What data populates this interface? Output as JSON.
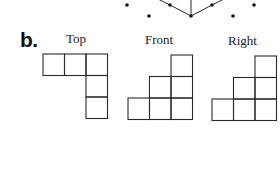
{
  "figure": {
    "part_label": "b.",
    "isometric_dot_diagram": {
      "dots": [
        {
          "x": 127,
          "y": 5
        },
        {
          "x": 170,
          "y": 5
        },
        {
          "x": 212,
          "y": 5
        },
        {
          "x": 254,
          "y": 5
        },
        {
          "x": 149,
          "y": 16
        },
        {
          "x": 191,
          "y": 16
        },
        {
          "x": 233,
          "y": 16
        }
      ],
      "edges": [
        {
          "x1": 158,
          "y1": -1,
          "x2": 170,
          "y2": 5
        },
        {
          "x1": 170,
          "y1": 5,
          "x2": 191,
          "y2": 16
        },
        {
          "x1": 191,
          "y1": 16,
          "x2": 212,
          "y2": 5
        },
        {
          "x1": 212,
          "y1": 5,
          "x2": 224,
          "y2": -1
        },
        {
          "x1": 191,
          "y1": 16,
          "x2": 191,
          "y2": -1
        }
      ]
    },
    "views": [
      {
        "name": "Top",
        "label": "Top",
        "label_pos": {
          "x": 66,
          "y": 31
        },
        "origin": {
          "x": 43,
          "y": 54
        },
        "cell": 21.5,
        "cells": [
          [
            0,
            0
          ],
          [
            1,
            0
          ],
          [
            2,
            0
          ],
          [
            2,
            1
          ],
          [
            2,
            2
          ]
        ]
      },
      {
        "name": "Front",
        "label": "Front",
        "label_pos": {
          "x": 145,
          "y": 32
        },
        "origin": {
          "x": 128,
          "y": 55
        },
        "cell": 21.5,
        "cells": [
          [
            2,
            0
          ],
          [
            1,
            1
          ],
          [
            2,
            1
          ],
          [
            0,
            2
          ],
          [
            1,
            2
          ],
          [
            2,
            2
          ]
        ]
      },
      {
        "name": "Right",
        "label": "Right",
        "label_pos": {
          "x": 228,
          "y": 33
        },
        "origin": {
          "x": 212,
          "y": 56
        },
        "cell": 21.5,
        "cells": [
          [
            2,
            0
          ],
          [
            1,
            1
          ],
          [
            2,
            1
          ],
          [
            0,
            2
          ],
          [
            1,
            2
          ],
          [
            2,
            2
          ]
        ]
      }
    ],
    "colors": {
      "line": "#2a2a2a",
      "dot": "#111111",
      "background": "#ffffff"
    }
  }
}
